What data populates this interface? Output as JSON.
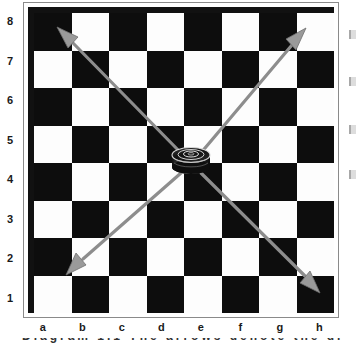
{
  "board": {
    "files": [
      "a",
      "b",
      "c",
      "d",
      "e",
      "f",
      "g",
      "h"
    ],
    "ranks": [
      "8",
      "7",
      "6",
      "5",
      "4",
      "3",
      "2",
      "1"
    ],
    "light_square_color": "#fdfdfd",
    "dark_square_color": "#0d0d0d",
    "frame_color": "#8a8a8a",
    "inner_border_color": "#111111",
    "size": 8
  },
  "piece": {
    "name": "piece-on-d5",
    "square": "d5",
    "file_index": 3,
    "rank_index": 3,
    "color": "#1b1b1b",
    "highlight_color": "#e8e8e8"
  },
  "arrows": {
    "color": "#8d8d8d",
    "head_color": "#9a9a9a",
    "width": 3,
    "origin_square": "d5",
    "items": [
      {
        "name": "arrow-up-left",
        "to_square": "a8",
        "direction": "up-left"
      },
      {
        "name": "arrow-up-right",
        "to_square": "h8",
        "direction": "up-right"
      },
      {
        "name": "arrow-down-left",
        "to_square": "a2",
        "direction": "down-left"
      },
      {
        "name": "arrow-down-right",
        "to_square": "h1",
        "direction": "down-right"
      }
    ]
  },
  "edge_marks": {
    "count": 4,
    "note": "clipped text fragments at right edge"
  },
  "clipped_caption": {
    "text": "Diagram  1.1 The arrows denote the direction"
  }
}
